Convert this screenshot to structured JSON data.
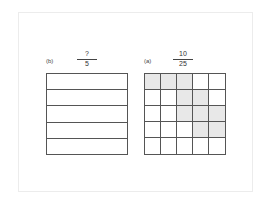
{
  "left": {
    "label": "(b)",
    "numerator": "?",
    "denominator": "5",
    "rows": 5
  },
  "right": {
    "label": "(a)",
    "numerator": "10",
    "denominator": "25",
    "size": 5,
    "shaded": [
      [
        0,
        0
      ],
      [
        0,
        1
      ],
      [
        0,
        2
      ],
      [
        1,
        2
      ],
      [
        1,
        3
      ],
      [
        2,
        2
      ],
      [
        2,
        3
      ],
      [
        2,
        4
      ],
      [
        3,
        3
      ],
      [
        3,
        4
      ]
    ],
    "shade_color": "#e8e8e8"
  }
}
